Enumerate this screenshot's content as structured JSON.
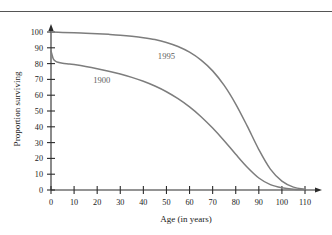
{
  "chart_data": {
    "type": "line",
    "title": "",
    "xlabel": "Age (in years)",
    "ylabel": "Proportion surviving",
    "xlim": [
      0,
      110
    ],
    "ylim": [
      0,
      100
    ],
    "xticks": [
      0,
      10,
      20,
      30,
      40,
      50,
      60,
      70,
      80,
      90,
      100,
      110
    ],
    "yticks": [
      0,
      10,
      20,
      30,
      40,
      50,
      60,
      70,
      80,
      90,
      100
    ],
    "grid": false,
    "legend_position": "inline-annotation",
    "series_color": "#7d7d7d",
    "axis_color": "#2b2b2b",
    "series": [
      {
        "name": "1900",
        "label": "1900",
        "label_x": 22,
        "label_y": 68,
        "x": [
          0,
          1,
          2,
          3,
          5,
          8,
          10,
          15,
          20,
          25,
          30,
          35,
          40,
          45,
          50,
          55,
          60,
          65,
          70,
          75,
          80,
          85,
          90,
          95,
          100,
          105,
          110
        ],
        "values": [
          88,
          83,
          81.5,
          80.8,
          80.2,
          79.8,
          79.4,
          78.2,
          76.8,
          75.2,
          73.4,
          71.3,
          68.8,
          65.8,
          62.2,
          57.8,
          52.6,
          46.4,
          39.2,
          31.2,
          22.6,
          14.4,
          7.6,
          3.4,
          1.4,
          0.5,
          0.2
        ]
      },
      {
        "name": "1995",
        "label": "1995",
        "label_x": 50,
        "label_y": 83,
        "x": [
          0,
          5,
          10,
          15,
          20,
          25,
          30,
          35,
          40,
          45,
          50,
          55,
          60,
          65,
          70,
          75,
          80,
          85,
          90,
          95,
          100,
          105,
          110
        ],
        "values": [
          100,
          99.7,
          99.5,
          99.2,
          98.9,
          98.5,
          98,
          97.3,
          96.4,
          95.2,
          93.4,
          90.8,
          87.2,
          82.2,
          75.4,
          66.2,
          54.4,
          40.4,
          25.6,
          13.2,
          5.6,
          1.8,
          0.4
        ]
      }
    ]
  },
  "axis": {
    "y_title": "Proportion surviving",
    "x_title": "Age (in years)"
  }
}
